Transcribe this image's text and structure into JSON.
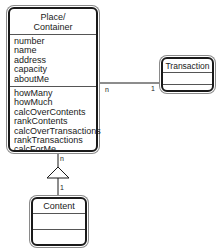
{
  "diagram": {
    "type": "UML class diagram",
    "classes": {
      "place": {
        "name": "Place/\nContainer",
        "name_line1": "Place/",
        "name_line2": "Container",
        "attributes": [
          "number",
          "name",
          "address",
          "capacity",
          "aboutMe"
        ],
        "operations": [
          "howMany",
          "howMuch",
          "calcOverContents",
          "rankContents",
          "calcOverTransactions",
          "rankTransactions",
          "calcForMe"
        ]
      },
      "transaction": {
        "name": "Transaction",
        "attributes": [],
        "operations": []
      },
      "content": {
        "name": "Content",
        "attributes": [],
        "operations": []
      }
    },
    "relationships": [
      {
        "from": "Place/Container",
        "to": "Transaction",
        "type": "association",
        "from_multiplicity": "n",
        "to_multiplicity": "1"
      },
      {
        "from": "Place/Container",
        "to": "Content",
        "type": "aggregation/whole-part",
        "from_multiplicity": "n",
        "to_multiplicity": "1"
      }
    ],
    "multiplicities": {
      "place_transaction_n": "n",
      "place_transaction_1": "1",
      "place_content_n": "n",
      "place_content_1": "1"
    },
    "colors": {
      "line": "#1a1a1a",
      "background": "#ffffff"
    }
  }
}
